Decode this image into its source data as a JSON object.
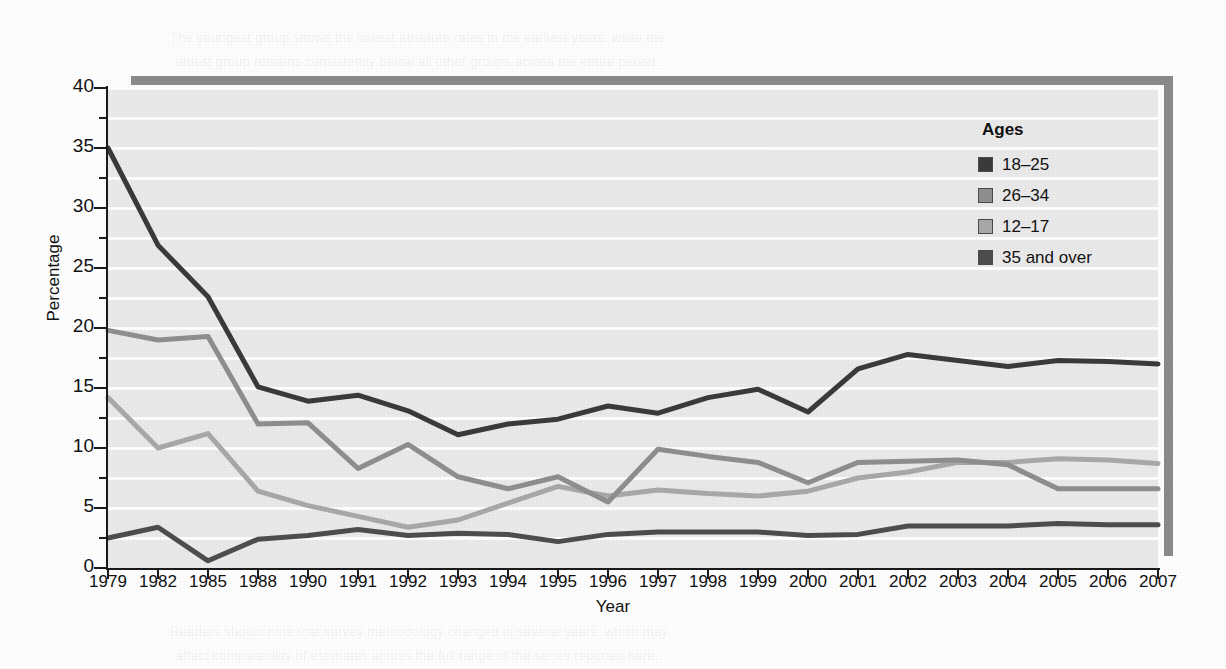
{
  "chart_data": {
    "type": "line",
    "title": "",
    "xlabel": "Year",
    "ylabel": "Percentage",
    "ylim": [
      0,
      40
    ],
    "ytick_step": 5,
    "yminor_step": 2.5,
    "grid": "horizontal-white",
    "legend_position": "top-right",
    "legend_title": "Ages",
    "categories": [
      "1979",
      "1982",
      "1985",
      "1988",
      "1990",
      "1991",
      "1992",
      "1993",
      "1994",
      "1995",
      "1996",
      "1997",
      "1998",
      "1999",
      "2000",
      "2001",
      "2002",
      "2003",
      "2004",
      "2005",
      "2006",
      "2007"
    ],
    "ytick_labels": [
      "0",
      "5",
      "10",
      "15",
      "20",
      "25",
      "30",
      "35",
      "40"
    ],
    "series": [
      {
        "name": "18–25",
        "color": "#3a3a3a",
        "values": [
          35.0,
          26.9,
          22.6,
          15.1,
          13.9,
          14.4,
          13.1,
          11.1,
          12.0,
          12.4,
          13.5,
          12.9,
          14.2,
          14.9,
          13.0,
          16.6,
          17.8,
          17.3,
          16.8,
          17.3,
          17.2,
          17.0
        ]
      },
      {
        "name": "26–34",
        "color": "#8e8e8e",
        "values": [
          19.8,
          19.0,
          19.3,
          12.0,
          12.1,
          8.3,
          10.3,
          7.6,
          6.6,
          7.6,
          5.5,
          9.9,
          9.3,
          8.8,
          7.1,
          8.8,
          8.9,
          9.0,
          8.6,
          6.6,
          6.6,
          6.6
        ]
      },
      {
        "name": "12–17",
        "color": "#a8a8a8",
        "values": [
          14.2,
          10.0,
          11.2,
          6.4,
          5.2,
          4.3,
          3.4,
          4.0,
          5.4,
          6.8,
          6.0,
          6.5,
          6.2,
          6.0,
          6.4,
          7.5,
          8.0,
          8.8,
          8.8,
          9.1,
          9.0,
          8.7
        ]
      },
      {
        "name": "35 and over",
        "color": "#4d4d4d",
        "values": [
          2.5,
          3.4,
          0.6,
          2.4,
          2.7,
          3.2,
          2.7,
          2.9,
          2.8,
          2.2,
          2.8,
          3.0,
          3.0,
          3.0,
          2.7,
          2.8,
          3.5,
          3.5,
          3.5,
          3.7,
          3.6,
          3.6
        ]
      }
    ]
  },
  "background_text": {
    "heading": "Illicit Drug Use Among Current Cigarette Users",
    "lines": [
      "Cigarette smoking has long been associated with the use of other substances and",
      "is often regarded as a gateway behavior. Rates of illicit drug use are substantially",
      "higher among persons who report current cigarette use compared with persons who",
      "do not smoke. This pattern is observed across all age groups in the survey data,",
      "though the magnitude of the difference varies by age and by the specific substance",
      "examined.",
      "Cigarette use and illicit drug use among young persons declined sharply during the",
      "early 1980s, remained comparatively stable through the middle 1990s, and then rose",
      "again in the late 1990s and early 2000s before flattening out over the final years",
      "of the series shown.",
      "The youngest group shows the lowest absolute rates in the earliest years, while the",
      "oldest group remains consistently below all other groups across the entire period.",
      "Readers should note that survey methodology changed in several years, which may",
      "affect comparability of estimates across the full range of the series reported here."
    ]
  }
}
